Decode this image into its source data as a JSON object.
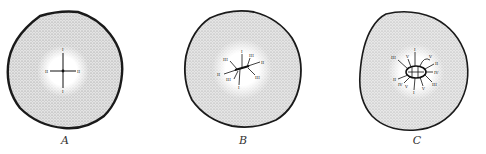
{
  "figure": {
    "panels": [
      {
        "id": "A",
        "label": "A",
        "numerals": [
          "I",
          "I",
          "II",
          "II"
        ]
      },
      {
        "id": "B",
        "label": "B",
        "numerals": [
          "I",
          "I",
          "II",
          "II",
          "III",
          "III",
          "III",
          "III"
        ]
      },
      {
        "id": "C",
        "label": "C",
        "numerals": [
          "I",
          "I",
          "II",
          "II",
          "III",
          "III",
          "IV",
          "IV",
          "V",
          "V",
          "V",
          "V"
        ]
      }
    ],
    "colors": {
      "outline": "#1a1a1a",
      "stipple": "#cfcfcf",
      "center": "#ffffff",
      "lines": "#111111"
    }
  }
}
